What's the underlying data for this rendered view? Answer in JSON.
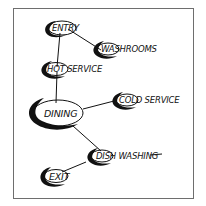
{
  "diagram": {
    "type": "bubble-adjacency-diagram",
    "colors": {
      "ink": "#111111",
      "frame": "#6e6e6e",
      "background": "#ffffff"
    },
    "nodes": [
      {
        "id": "entry",
        "label": "ENTRY"
      },
      {
        "id": "washrooms",
        "label": "WASHROOMS"
      },
      {
        "id": "hot_service",
        "label": "HOT SERVICE"
      },
      {
        "id": "dining",
        "label": "DINING"
      },
      {
        "id": "cold_service",
        "label": "COLD SERVICE"
      },
      {
        "id": "dish_washing",
        "label": "DISH WASHING"
      },
      {
        "id": "exit",
        "label": "EXIT"
      }
    ],
    "edges": [
      {
        "from": "entry",
        "to": "washrooms"
      },
      {
        "from": "entry",
        "to": "hot_service"
      },
      {
        "from": "hot_service",
        "to": "dining"
      },
      {
        "from": "dining",
        "to": "cold_service"
      },
      {
        "from": "dining",
        "to": "dish_washing"
      },
      {
        "from": "dish_washing",
        "to": "exit"
      }
    ]
  }
}
